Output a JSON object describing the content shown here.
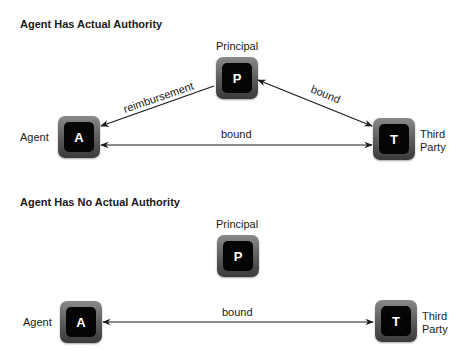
{
  "sections": [
    {
      "title": "Agent Has Actual Authority",
      "nodes": {
        "principal": {
          "letter": "P",
          "label": "Principal"
        },
        "agent": {
          "letter": "A",
          "label": "Agent"
        },
        "third_party": {
          "letter": "T",
          "label_line1": "Third",
          "label_line2": "Party"
        }
      },
      "edges": [
        {
          "from": "principal",
          "to": "agent",
          "label": "reimbursement",
          "direction": "to-agent"
        },
        {
          "from": "principal",
          "to": "third_party",
          "label": "bound",
          "direction": "both"
        },
        {
          "from": "agent",
          "to": "third_party",
          "label": "bound",
          "direction": "both"
        }
      ]
    },
    {
      "title": "Agent Has No Actual Authority",
      "nodes": {
        "principal": {
          "letter": "P",
          "label": "Principal"
        },
        "agent": {
          "letter": "A",
          "label": "Agent"
        },
        "third_party": {
          "letter": "T",
          "label_line1": "Third",
          "label_line2": "Party"
        }
      },
      "edges": [
        {
          "from": "agent",
          "to": "third_party",
          "label": "bound",
          "direction": "both"
        }
      ]
    }
  ]
}
